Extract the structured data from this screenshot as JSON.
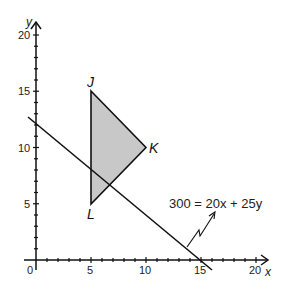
{
  "diagram": {
    "type": "coordinate-plane",
    "axes": {
      "x_label": "x",
      "y_label": "y",
      "origin_label": "0",
      "x_ticks": [
        "5",
        "10",
        "15",
        "20"
      ],
      "y_ticks": [
        "5",
        "10",
        "15",
        "20"
      ],
      "x_range": [
        0,
        20
      ],
      "y_range": [
        0,
        20
      ]
    },
    "triangle": {
      "fill": "#c8c8c8",
      "vertices": [
        {
          "label": "J",
          "x": 5,
          "y": 15
        },
        {
          "label": "K",
          "x": 10,
          "y": 10
        },
        {
          "label": "L",
          "x": 5,
          "y": 5
        }
      ]
    },
    "line": {
      "equation_label": "300 = 20x + 25y",
      "x_intercept": 15,
      "y_intercept": 12
    }
  }
}
